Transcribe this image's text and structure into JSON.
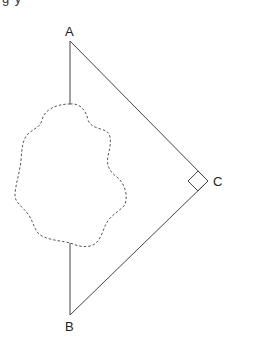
{
  "figure": {
    "top_text_fragment": "g     y",
    "vertices": [
      {
        "id": "A",
        "label": "A",
        "x": 70,
        "y": 41
      },
      {
        "id": "B",
        "label": "B",
        "x": 70,
        "y": 315
      },
      {
        "id": "C",
        "label": "C",
        "x": 208,
        "y": 181
      }
    ],
    "right_angle_at": "C",
    "obstacle": "dashed irregular region between A and B",
    "colors": {
      "line": "#444444",
      "dashed": "#555555"
    }
  }
}
